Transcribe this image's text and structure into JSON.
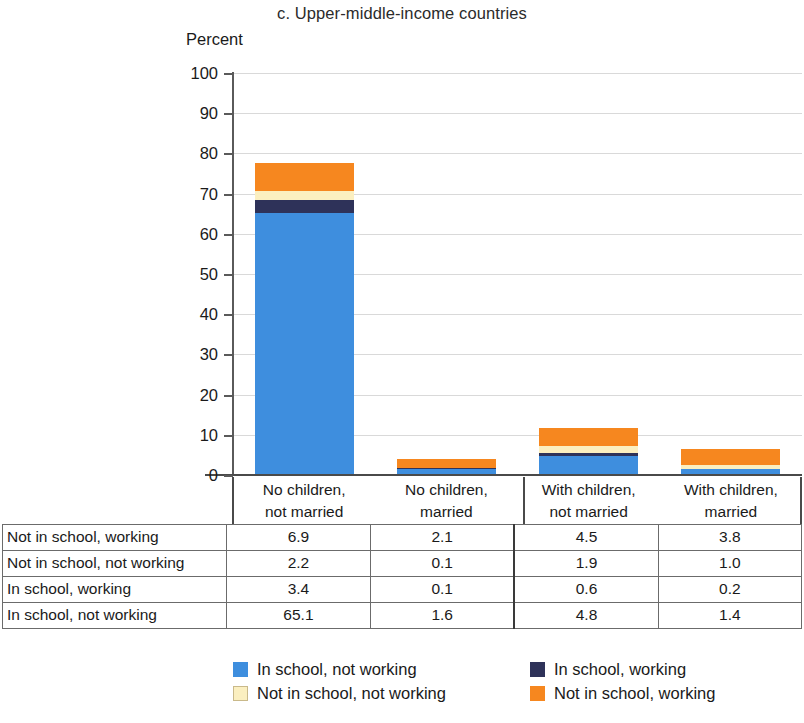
{
  "title": "c. Upper-middle-income countries",
  "y_axis_title": "Percent",
  "colors": {
    "in_school_not_working": "#3E8EDE",
    "in_school_working": "#2E3259",
    "not_in_school_not_working": "#FBEFC0",
    "not_in_school_working": "#F6871F",
    "gridline": "#d9d9d9",
    "axis": "#4a4a4a"
  },
  "legend": {
    "items": [
      {
        "label": "In school, not working",
        "color_key": "in_school_not_working"
      },
      {
        "label": "In school, working",
        "color_key": "in_school_working"
      },
      {
        "label": "Not in school, not working",
        "color_key": "not_in_school_not_working"
      },
      {
        "label": "Not in school, working",
        "color_key": "not_in_school_working"
      }
    ]
  },
  "categories_two_line": [
    {
      "line1": "No children,",
      "line2": "not married"
    },
    {
      "line1": "No children,",
      "line2": "married"
    },
    {
      "line1": "With children,",
      "line2": "not married"
    },
    {
      "line1": "With children,",
      "line2": "married"
    }
  ],
  "table": {
    "rows": [
      {
        "label": "Not in school, working",
        "values": [
          "6.9",
          "2.1",
          "4.5",
          "3.8"
        ]
      },
      {
        "label": "Not in school, not working",
        "values": [
          "2.2",
          "0.1",
          "1.9",
          "1.0"
        ]
      },
      {
        "label": "In school, working",
        "values": [
          "3.4",
          "0.1",
          "0.6",
          "0.2"
        ]
      },
      {
        "label": "In school, not working",
        "values": [
          "65.1",
          "1.6",
          "4.8",
          "1.4"
        ]
      }
    ]
  },
  "chart_data": {
    "type": "bar",
    "title": "c. Upper-middle-income countries",
    "xlabel": "",
    "ylabel": "Percent",
    "ylim": [
      0,
      100
    ],
    "yticks": [
      0,
      10,
      20,
      30,
      40,
      50,
      60,
      70,
      80,
      90,
      100
    ],
    "grid": true,
    "stacked": true,
    "legend_position": "bottom",
    "categories": [
      "No children, not married",
      "No children, married",
      "With children, not married",
      "With children, married"
    ],
    "series": [
      {
        "name": "In school, not working",
        "values": [
          65.1,
          1.6,
          4.8,
          1.4
        ]
      },
      {
        "name": "In school, working",
        "values": [
          3.4,
          0.1,
          0.6,
          0.2
        ]
      },
      {
        "name": "Not in school, not working",
        "values": [
          2.2,
          0.1,
          1.9,
          1.0
        ]
      },
      {
        "name": "Not in school, working",
        "values": [
          6.9,
          2.1,
          4.5,
          3.8
        ]
      }
    ],
    "totals": [
      77.6,
      3.9,
      11.8,
      6.4
    ]
  }
}
